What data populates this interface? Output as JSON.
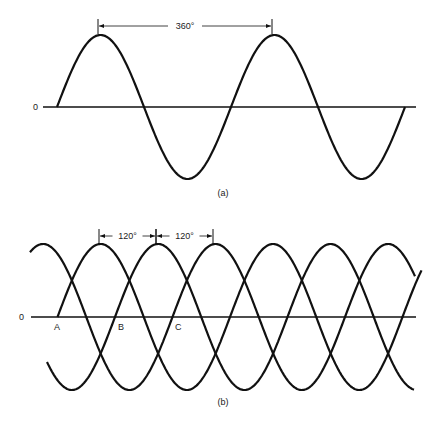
{
  "figure_a": {
    "caption": "(a)",
    "zero_label": "0",
    "dimension_label": "360°",
    "axis": {
      "x1": 43,
      "x2": 416,
      "y": 107
    },
    "wave": {
      "start_x": 57,
      "end_x": 405,
      "period_px": 174,
      "amplitude_px": 72,
      "phase_deg": 0
    },
    "dimension": {
      "x1": 98,
      "x2": 272,
      "y": 26
    }
  },
  "figure_b": {
    "caption": "(b)",
    "zero_label": "0",
    "point_labels": [
      "A",
      "B",
      "C"
    ],
    "dimension_labels": [
      "120°",
      "120°"
    ],
    "axis": {
      "x1": 31,
      "x2": 416,
      "y": 317
    },
    "amplitude_px": 73,
    "period_px": 172.5,
    "waves": [
      {
        "name": "A",
        "origin_x": 57.5,
        "start_x": 57.5,
        "end_x": 422
      },
      {
        "name": "B",
        "origin_x": 115,
        "start_x": 47,
        "end_x": 414
      },
      {
        "name": "C",
        "origin_x": 172.5,
        "start_x": 30,
        "end_x": 415
      }
    ],
    "dimensions": [
      {
        "x1": 99,
        "x2": 156,
        "y": 236
      },
      {
        "x1": 156,
        "x2": 213,
        "y": 236
      }
    ],
    "label_positions": [
      {
        "x": 54,
        "y": 330
      },
      {
        "x": 118,
        "y": 330
      },
      {
        "x": 175,
        "y": 330
      }
    ]
  }
}
